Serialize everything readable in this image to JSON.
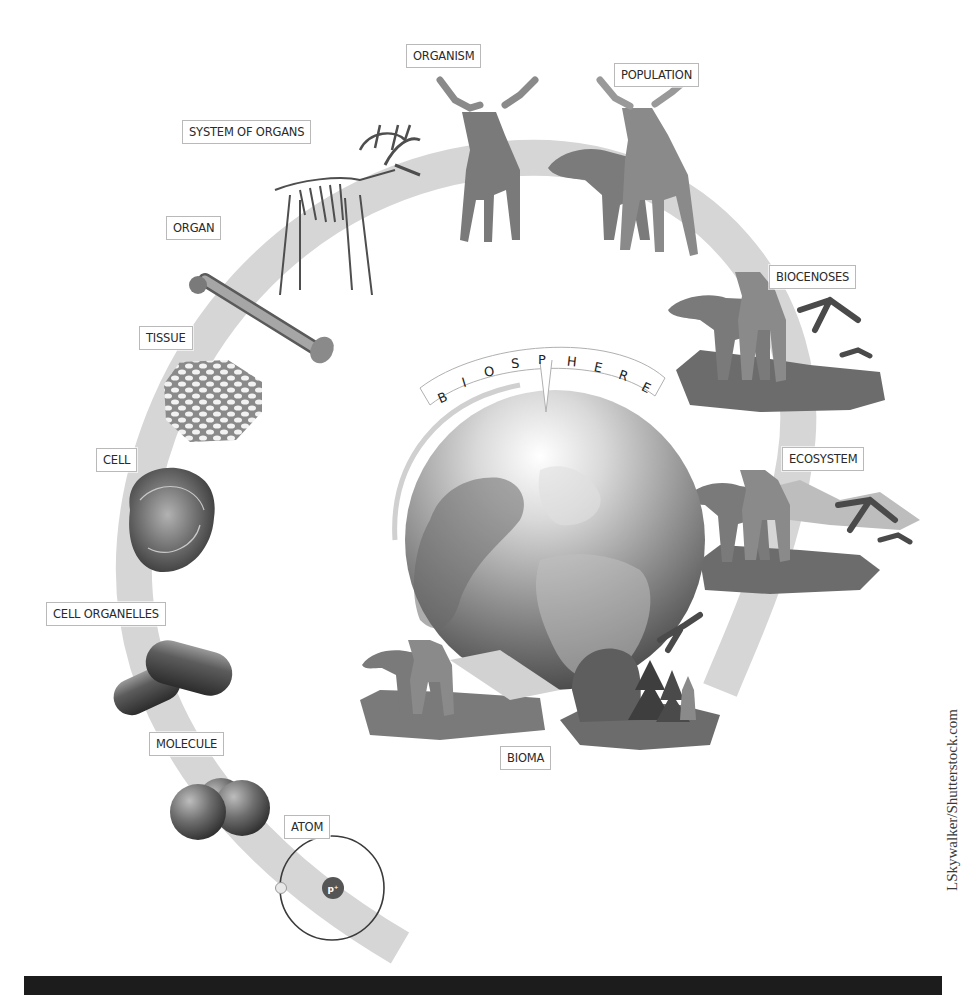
{
  "diagram": {
    "type": "levels-of-biological-organization",
    "levels": [
      {
        "id": "atom",
        "label": "ATOM",
        "illustration": "atom-with-proton-and-electron",
        "nucleus_label": "P+"
      },
      {
        "id": "molecule",
        "label": "MOLECULE",
        "illustration": "three-sphere-molecule"
      },
      {
        "id": "cell-organelles",
        "label": "CELL ORGANELLES",
        "illustration": "two-capsule-organelles"
      },
      {
        "id": "cell",
        "label": "CELL",
        "illustration": "round-cell"
      },
      {
        "id": "tissue",
        "label": "TISSUE",
        "illustration": "hexagonal-tissue-mesh"
      },
      {
        "id": "organ",
        "label": "ORGAN",
        "illustration": "femur-bone"
      },
      {
        "id": "system-of-organs",
        "label": "SYSTEM OF ORGANS",
        "illustration": "moose-skeleton"
      },
      {
        "id": "organism",
        "label": "ORGANISM",
        "illustration": "single-moose"
      },
      {
        "id": "population",
        "label": "POPULATION",
        "illustration": "two-moose"
      },
      {
        "id": "biocenoses",
        "label": "BIOCENOSES",
        "illustration": "moose-cranes-fish-on-ground"
      },
      {
        "id": "ecosystem",
        "label": "ECOSYSTEM",
        "illustration": "moose-cranes-mountains-ground"
      },
      {
        "id": "bioma",
        "label": "BIOMA",
        "illustration": "moose-bear-fox-eagle-forest"
      }
    ],
    "center": {
      "label_letters": [
        "B",
        "I",
        "O",
        "S",
        "P",
        "H",
        "E",
        "R",
        "E"
      ],
      "illustration": "globe-earth"
    }
  },
  "credit": "LSkywalker/Shutterstock.com",
  "colors": {
    "ring": "#d6d6d6",
    "illustration_dark": "#5a5a5a",
    "illustration_mid": "#8c8c8c",
    "label_border": "#b9b9b9",
    "bottom_bar": "#1c1c1c"
  }
}
